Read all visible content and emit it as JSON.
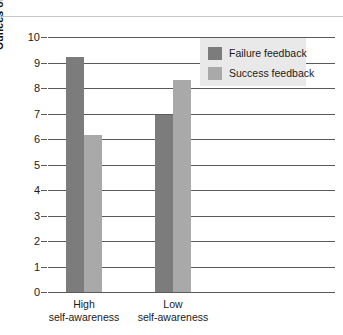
{
  "chart_data": {
    "type": "bar",
    "title": "",
    "xlabel": "",
    "ylabel": "Ounces of wine consumed",
    "ylim": [
      0,
      10
    ],
    "yticks": [
      "0",
      "1",
      "2",
      "3",
      "4",
      "5",
      "6",
      "7",
      "8",
      "9",
      "10"
    ],
    "grid": true,
    "legend_position": "upper right",
    "categories": [
      "High self-awareness",
      "Low self-awareness"
    ],
    "category_lines": [
      {
        "top": "High",
        "bottom": "self-awareness"
      },
      {
        "top": "Low",
        "bottom": "self-awareness"
      }
    ],
    "series": [
      {
        "name": "Failure feedback",
        "color": "#7c7c7c",
        "values": [
          9.2,
          6.95
        ]
      },
      {
        "name": "Success feedback",
        "color": "#a9a9a9",
        "values": [
          6.15,
          8.3
        ]
      }
    ]
  }
}
